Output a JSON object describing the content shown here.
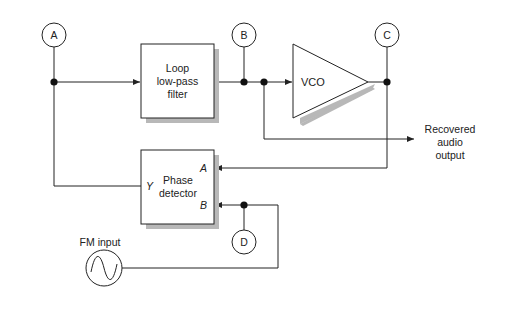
{
  "diagram": {
    "colors": {
      "rule_left": "#5b78c8",
      "rule_mid": "#c89ac8",
      "rule_right": "#6a82c8",
      "line": "#222222",
      "shadow": "#b8b8b8"
    },
    "test_points": {
      "A": "A",
      "B": "B",
      "C": "C",
      "D": "D"
    },
    "blocks": {
      "filter": {
        "line1": "Loop",
        "line2": "low-pass",
        "line3": "filter"
      },
      "vco": {
        "label": "VCO"
      },
      "phase_detector": {
        "line1": "Phase",
        "line2": "detector",
        "input_a": "A",
        "input_b": "B",
        "output_y": "Y"
      }
    },
    "output": {
      "line1": "Recovered",
      "line2": "audio",
      "line3": "output"
    },
    "input": {
      "label": "FM input"
    }
  }
}
